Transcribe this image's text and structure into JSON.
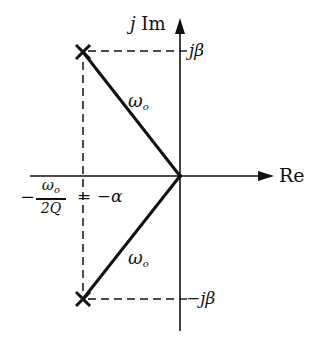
{
  "diagram": {
    "type": "s-plane pole plot",
    "axes": {
      "imaginary_label_prefix": "j",
      "imaginary_label": "Im",
      "real_label": "Re"
    },
    "poles": [
      {
        "name": "upper-pole",
        "symbol": "×",
        "label_im": "jβ"
      },
      {
        "name": "lower-pole",
        "symbol": "×",
        "label_im": "−jβ"
      }
    ],
    "vectors": [
      {
        "name": "upper-vector",
        "label": "ω",
        "subscript": "o"
      },
      {
        "name": "lower-vector",
        "label": "ω",
        "subscript": "o"
      }
    ],
    "real_part_label": {
      "minus": "−",
      "numerator": "ω",
      "numerator_sub": "o",
      "denominator": "2Q",
      "equals": "= −α"
    },
    "colors": {
      "line": "#111111",
      "background": "#ffffff"
    }
  }
}
